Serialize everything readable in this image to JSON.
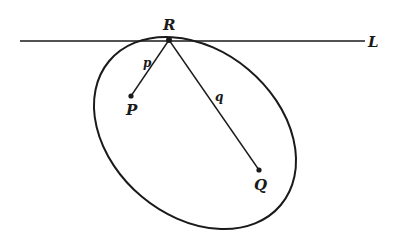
{
  "diagram": {
    "line_label": "L",
    "points": [
      {
        "id": "R",
        "label": "R",
        "x": 169,
        "y": 40
      },
      {
        "id": "P",
        "label": "P",
        "x": 131,
        "y": 96
      },
      {
        "id": "Q",
        "label": "Q",
        "x": 259,
        "y": 170
      }
    ],
    "segments": [
      {
        "from": "R",
        "to": "P",
        "label": "p"
      },
      {
        "from": "R",
        "to": "Q",
        "label": "q"
      }
    ],
    "ellipse": {
      "cx": 195,
      "cy": 133,
      "rx": 112,
      "ry": 83,
      "rotation_deg": 40
    },
    "tangent_line": {
      "x1": 20,
      "y1": 41,
      "x2": 365,
      "y2": 41
    },
    "stroke_color": "#1a1a1a",
    "labels": {
      "R": "R",
      "P": "P",
      "Q": "Q",
      "L": "L",
      "p": "p",
      "q": "q"
    }
  }
}
